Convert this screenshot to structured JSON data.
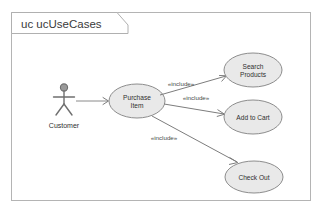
{
  "diagram": {
    "frame": {
      "kind_keyword": "uc",
      "name": "ucUseCases",
      "tab_label": "uc ucUseCases"
    },
    "colors": {
      "frame_border": "#b4b4b4",
      "ellipse_fill": "#e9e9e9",
      "ellipse_border": "#8d8d8d",
      "actor_stroke": "#6f6f6f",
      "connector": "#7d7d7d",
      "text": "#2f2f2f"
    },
    "actors": [
      {
        "id": "customer",
        "label": "Customer",
        "cx": 64,
        "cy": 100,
        "label_x": 64,
        "label_y": 127
      }
    ],
    "use_cases": [
      {
        "id": "purchase-item",
        "label": "Purchase Item",
        "lines": [
          "Purchase",
          "Item"
        ],
        "cx": 137,
        "cy": 101,
        "rx": 28,
        "ry": 17
      },
      {
        "id": "search-products",
        "label": "Search Products",
        "lines": [
          "Search",
          "Products"
        ],
        "cx": 253,
        "cy": 70,
        "rx": 29,
        "ry": 17
      },
      {
        "id": "add-to-cart",
        "label": "Add to Cart",
        "lines": [
          "Add to Cart"
        ],
        "cx": 253,
        "cy": 117,
        "rx": 29,
        "ry": 17
      },
      {
        "id": "check-out",
        "label": "Check Out",
        "lines": [
          "Check Out"
        ],
        "cx": 254,
        "cy": 177,
        "rx": 29,
        "ry": 16
      }
    ],
    "associations": [
      {
        "id": "customer-purchase-item",
        "from": "customer",
        "to": "purchase-item",
        "x1": 76,
        "y1": 101,
        "x2": 108,
        "y2": 101
      }
    ],
    "include_relations": [
      {
        "id": "include-search-products",
        "from": "purchase-item",
        "to": "search-products",
        "stereotype": "«include»",
        "x1": 160,
        "y1": 95,
        "x2": 226,
        "y2": 76,
        "label_x": 181,
        "label_y": 85
      },
      {
        "id": "include-add-to-cart",
        "from": "purchase-item",
        "to": "add-to-cart",
        "stereotype": "«include»",
        "x1": 164,
        "y1": 104,
        "x2": 224,
        "y2": 114,
        "label_x": 196,
        "label_y": 99
      },
      {
        "id": "include-check-out",
        "from": "purchase-item",
        "to": "check-out",
        "stereotype": "«include»",
        "x1": 152,
        "y1": 116,
        "x2": 237,
        "y2": 162,
        "label_x": 164,
        "label_y": 139
      }
    ]
  }
}
